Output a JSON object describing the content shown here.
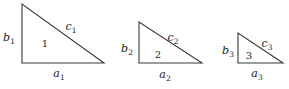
{
  "figure": {
    "background_color": "#ffffff",
    "stroke_color": "#3a3a3a",
    "text_color": "#222222",
    "triangles": [
      {
        "name": "triangle-1",
        "number": "1",
        "number_pos": [
          45,
          47
        ],
        "vertices": [
          [
            22,
            4
          ],
          [
            22,
            63
          ],
          [
            104,
            63
          ]
        ],
        "side_labels": [
          {
            "side": "left-leg",
            "base": "b",
            "sub": "1",
            "x": 9,
            "y": 41
          },
          {
            "side": "hypotenuse",
            "base": "c",
            "sub": "1",
            "x": 71,
            "y": 30
          },
          {
            "side": "bottom-leg",
            "base": "a",
            "sub": "1",
            "x": 59,
            "y": 77
          }
        ]
      },
      {
        "name": "triangle-2",
        "number": "2",
        "number_pos": [
          158,
          58
        ],
        "vertices": [
          [
            139,
            22
          ],
          [
            139,
            63
          ],
          [
            202,
            63
          ]
        ],
        "side_labels": [
          {
            "side": "left-leg",
            "base": "b",
            "sub": "2",
            "x": 127,
            "y": 52
          },
          {
            "side": "hypotenuse",
            "base": "c",
            "sub": "2",
            "x": 173,
            "y": 41
          },
          {
            "side": "bottom-leg",
            "base": "a",
            "sub": "2",
            "x": 165,
            "y": 78
          }
        ]
      },
      {
        "name": "triangle-3",
        "number": "3",
        "number_pos": [
          249,
          59
        ],
        "vertices": [
          [
            238,
            33
          ],
          [
            238,
            63
          ],
          [
            283,
            63
          ]
        ],
        "side_labels": [
          {
            "side": "left-leg",
            "base": "b",
            "sub": "3",
            "x": 228,
            "y": 54
          },
          {
            "side": "hypotenuse",
            "base": "c",
            "sub": "3",
            "x": 267,
            "y": 47
          },
          {
            "side": "bottom-leg",
            "base": "a",
            "sub": "3",
            "x": 257,
            "y": 77
          }
        ]
      }
    ]
  }
}
